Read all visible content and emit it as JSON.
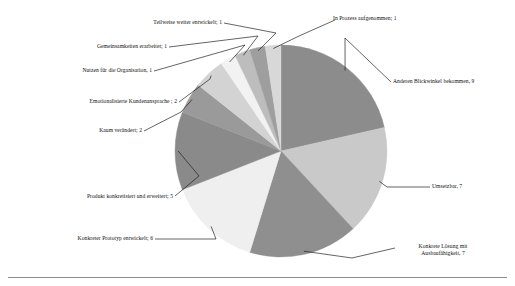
{
  "figure": {
    "background_color": "#ffffff",
    "has_bottom_rule": true
  },
  "chart_data": {
    "type": "pie",
    "title": "",
    "subtitle": "",
    "xlabel": "",
    "ylabel": "",
    "legend_position": "none",
    "labels_style": "callout leader lines outside slices",
    "total": 42,
    "start_angle_deg": 0,
    "direction": "clockwise",
    "categories": [
      "Anderen Blickwinkel bekommen",
      "Umsetzbar",
      "Konkrete Lösung mit Ausbaufähigkeit",
      "Konkreter Prototyp entwickelt",
      "Produkt konkretisiert und erweitert",
      "Kaum verändert",
      "Emotionalisierte Kundenansprache",
      "Nutzen für die Organisation",
      "Gemeinsamkeiten erarbeitet",
      "Teilweise weiter entwickelt",
      "In Prozess aufgenommen"
    ],
    "values": [
      9,
      7,
      7,
      6,
      5,
      2,
      2,
      1,
      1,
      1,
      1
    ],
    "colors": [
      "#8c8c8c",
      "#c9c9c9",
      "#8f8f8f",
      "#efefef",
      "#8a8a8a",
      "#9a9a9a",
      "#d3d3d3",
      "#f2f2f2",
      "#bdbdbd",
      "#9e9e9e",
      "#d8d8d8"
    ],
    "slices": [
      {
        "label": "Anderen Blickwinkel bekommen, 9",
        "name": "Anderen Blickwinkel bekommen",
        "value": 9,
        "color": "#8c8c8c",
        "callout_side": "right"
      },
      {
        "label": "Umsetzbar, 7",
        "name": "Umsetzbar",
        "value": 7,
        "color": "#c9c9c9",
        "callout_side": "right"
      },
      {
        "label": "Konkrete Lösung mit",
        "label_line2": "Ausbaufähigkeit, 7",
        "name": "Konkrete Lösung mit Ausbaufähigkeit",
        "value": 7,
        "color": "#8f8f8f",
        "callout_side": "right"
      },
      {
        "label": "Konkreter Prototyp entwickelt; 6",
        "name": "Konkreter Prototyp entwickelt",
        "value": 6,
        "color": "#efefef",
        "callout_side": "left"
      },
      {
        "label": "Produkt konkretisiert und erweitert; 5",
        "name": "Produkt konkretisiert und erweitert",
        "value": 5,
        "color": "#8a8a8a",
        "callout_side": "left"
      },
      {
        "label": "Kaum verändert; 2",
        "name": "Kaum verändert",
        "value": 2,
        "color": "#9a9a9a",
        "callout_side": "left"
      },
      {
        "label": "Emotionalisierte Kundenansprache ; 2",
        "name": "Emotionalisierte Kundenansprache",
        "value": 2,
        "color": "#d3d3d3",
        "callout_side": "left"
      },
      {
        "label": "Nutzen für die Organisation, 1",
        "name": "Nutzen für die Organisation",
        "value": 1,
        "color": "#f2f2f2",
        "callout_side": "left"
      },
      {
        "label": "Gemeinsamkeiten erarbeitet; 1",
        "name": "Gemeinsamkeiten erarbeitet",
        "value": 1,
        "color": "#bdbdbd",
        "callout_side": "left"
      },
      {
        "label": "Teilweise weiter entwickelt; 1",
        "name": "Teilweise weiter entwickelt",
        "value": 1,
        "color": "#9e9e9e",
        "callout_side": "left"
      },
      {
        "label": "In Prozess aufgenommen; 1",
        "name": "In Prozess aufgenommen",
        "value": 1,
        "color": "#d8d8d8",
        "callout_side": "right"
      }
    ]
  }
}
